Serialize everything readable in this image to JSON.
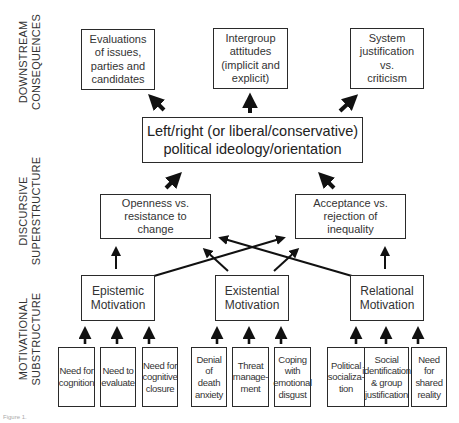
{
  "layers": {
    "downstream": "DOWNSTREAM\nCONSEQUENCES",
    "discursive": "DISCURSIVE\nSUPERSTRUCTURE",
    "motivational": "MOTIVATIONAL\nSUBSTRUCTURE"
  },
  "consequences": [
    {
      "label": "Evaluations\nof issues,\nparties and\ncandidates"
    },
    {
      "label": "Intergroup\nattitudes\n(implicit and\nexplicit)"
    },
    {
      "label": "System\njustification\nvs.\ncriticism"
    }
  ],
  "ideology": {
    "label": "Left/right (or liberal/conservative)\npolitical ideology/orientation"
  },
  "superstructure": [
    {
      "label": "Openness vs.\nresistance to\nchange"
    },
    {
      "label": "Acceptance vs.\nrejection of\ninequality"
    }
  ],
  "motivations": [
    {
      "label": "Epistemic\nMotivation"
    },
    {
      "label": "Existential\nMotivation"
    },
    {
      "label": "Relational\nMotivation"
    }
  ],
  "needs": [
    {
      "label": "Need for\ncognition"
    },
    {
      "label": "Need to\nevaluate"
    },
    {
      "label": "Need for\ncognitive\nclosure"
    },
    {
      "label": "Denial of\ndeath\nanxiety"
    },
    {
      "label": "Threat\nmanage-\nment"
    },
    {
      "label": "Coping\nwith\nemotional\ndisgust"
    },
    {
      "label": "Political\nsocializa-\ntion"
    },
    {
      "label": "Social\nidentification\n& group\njustification"
    },
    {
      "label": "Need for\nshared\nreality"
    }
  ],
  "caption": "Figure 1."
}
